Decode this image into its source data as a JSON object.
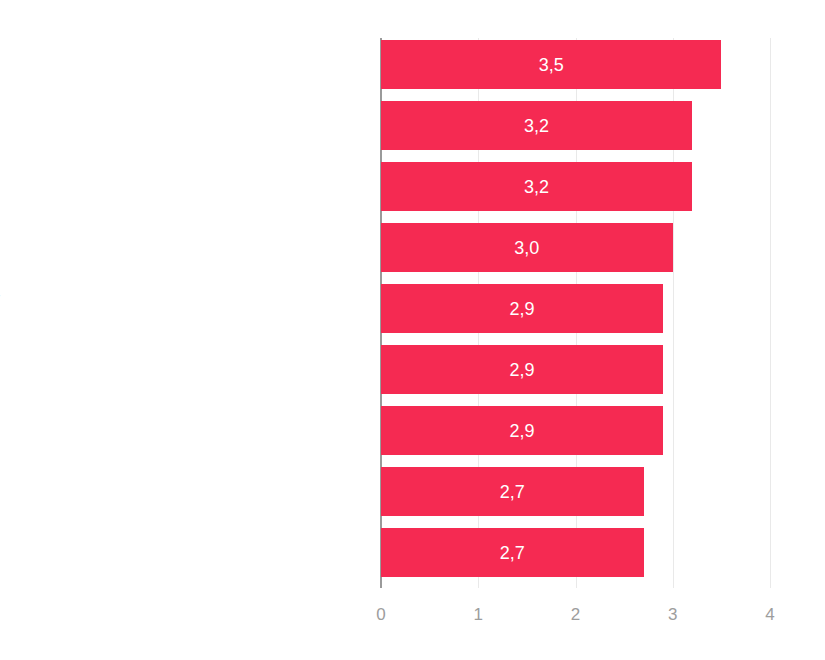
{
  "chart_data": {
    "type": "bar",
    "orientation": "horizontal",
    "title": "",
    "subtitle": "",
    "xlabel": "",
    "ylabel": "",
    "xlim": [
      0,
      4
    ],
    "grid": true,
    "legend": false,
    "decimal_separator": ",",
    "bar_color": "#f52a52",
    "label_color": "#8d8d8d",
    "tick_color": "#9d9d9d",
    "gridline_color": "#e9e9e9",
    "axis_color": "#9a9a9a",
    "value_label_color": "#ffffff",
    "categories": [
      "Competition with other personal trainers",
      "Changes in taxation",
      "Online fitness offerings",
      "Legal changes (e.g. labor law)",
      "Health technology (e.g. wearables, apps for self-motivation)",
      "Budget operators",
      "Outdoor offerings",
      "Boutique clubs",
      "Competition with physio therapists"
    ],
    "values": [
      3.5,
      3.2,
      3.2,
      3.0,
      2.9,
      2.9,
      2.9,
      2.7,
      2.7
    ],
    "value_labels": [
      "3,5",
      "3,2",
      "3,2",
      "3,0",
      "2,9",
      "2,9",
      "2,9",
      "2,7",
      "2,7"
    ],
    "xticks": [
      0,
      1,
      2,
      3,
      4
    ],
    "xtick_labels": [
      "0",
      "1",
      "2",
      "3",
      "4"
    ]
  }
}
